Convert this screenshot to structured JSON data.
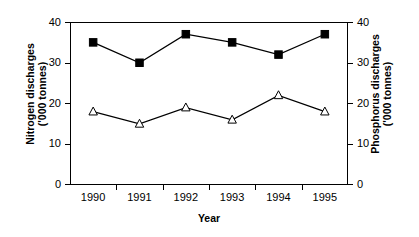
{
  "chart_data": {
    "type": "line",
    "title": "",
    "subtitle": "",
    "xlabel": "Year",
    "categories": [
      "1990",
      "1991",
      "1992",
      "1993",
      "1994",
      "1995"
    ],
    "x_tick_labels": [
      "1990",
      "1991",
      "1992",
      "1993",
      "1994",
      "1995"
    ],
    "y_tick_labels": [
      "0",
      "10",
      "20",
      "30",
      "40"
    ],
    "y_ticks": [
      0,
      10,
      20,
      30,
      40
    ],
    "ylim": [
      0,
      40
    ],
    "grid": false,
    "legend": "none",
    "background_color": "#ffffff",
    "frame_color": "#000000",
    "axes": {
      "left": {
        "label_line1": "Nitrogen discharges",
        "label_line2": "('000 tonnes)",
        "ylim": [
          0,
          40
        ],
        "ticks": [
          0,
          10,
          20,
          30,
          40
        ],
        "tick_labels": [
          "0",
          "10",
          "20",
          "30",
          "40"
        ]
      },
      "right": {
        "label_line1": "Phosphorus discharges",
        "label_line2": "('000 tonnes)",
        "ylim": [
          0,
          40
        ],
        "ticks": [
          0,
          10,
          20,
          30,
          40
        ],
        "tick_labels": [
          "0",
          "10",
          "20",
          "30",
          "40"
        ]
      }
    },
    "series": [
      {
        "name": "Nitrogen discharges",
        "axis": "left",
        "marker": "filled-square",
        "marker_color": "#000000",
        "line_color": "#000000",
        "values": [
          35,
          30,
          37,
          35,
          32,
          37
        ]
      },
      {
        "name": "Phosphorus discharges",
        "axis": "right",
        "marker": "open-triangle",
        "marker_color": "#ffffff",
        "line_color": "#000000",
        "values": [
          18,
          15,
          19,
          16,
          22,
          18
        ]
      }
    ]
  }
}
